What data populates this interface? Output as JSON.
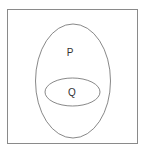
{
  "diagram": {
    "type": "venn-subset",
    "universe": {
      "label": ""
    },
    "sets": [
      {
        "id": "P",
        "label": "P"
      },
      {
        "id": "Q",
        "label": "Q"
      }
    ],
    "relation": "Q is a subset of P",
    "colors": {
      "stroke": "#6a6a6a",
      "background": "#ffffff",
      "text": "#333333"
    }
  }
}
